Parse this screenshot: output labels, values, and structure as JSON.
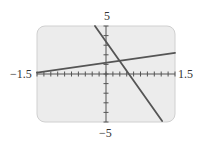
{
  "chart_data": {
    "type": "line",
    "title": "",
    "xlabel": "",
    "ylabel": "",
    "xlim": [
      -1.5,
      1.5
    ],
    "ylim": [
      -5,
      5
    ],
    "grid": false,
    "x_tick_step": 0.15,
    "y_tick_step": 1,
    "tick_labels": {
      "xmin": "−1.5",
      "xmax": "1.5",
      "ymax": "5",
      "ymin": "−5"
    },
    "series": [
      {
        "name": "line-1",
        "points": [
          [
            -1.5,
            0.15
          ],
          [
            1.5,
            2.2
          ]
        ],
        "equation": "y ≈ 0.68x + 1.17"
      },
      {
        "name": "line-2",
        "points": [
          [
            -0.24,
            5.0
          ],
          [
            1.22,
            -4.9
          ]
        ],
        "equation": "y ≈ -6.8x + 3.4"
      }
    ],
    "colors": {
      "background": "#ececec",
      "frame": "#d0d0d0",
      "axes": "#555555",
      "lines": "#555555"
    }
  }
}
